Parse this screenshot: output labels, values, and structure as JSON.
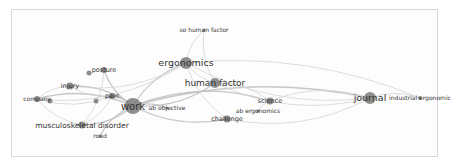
{
  "diagram": {
    "type": "keyword-co-occurrence-network",
    "nodes": [
      {
        "id": "work",
        "label": "work",
        "x": 133,
        "y": 106,
        "r": 8,
        "font": 10
      },
      {
        "id": "ergonomics",
        "label": "ergonomics",
        "x": 186,
        "y": 63,
        "r": 6,
        "font": 9.5
      },
      {
        "id": "human_factor",
        "label": "human factor",
        "x": 215,
        "y": 83,
        "r": 5,
        "font": 9
      },
      {
        "id": "journal",
        "label": "journal",
        "x": 370,
        "y": 98,
        "r": 6,
        "font": 9.5
      },
      {
        "id": "industrial_ergonomic",
        "label": "industrial ergonomic",
        "x": 420,
        "y": 98,
        "r": 2,
        "font": 6
      },
      {
        "id": "so_human_factor",
        "label": "so human factor",
        "x": 204,
        "y": 30,
        "r": 1.5,
        "font": 6
      },
      {
        "id": "posture",
        "label": "posture",
        "x": 104,
        "y": 70,
        "r": 3,
        "font": 6.5
      },
      {
        "id": "posture2",
        "label": "",
        "x": 89,
        "y": 73,
        "r": 2.5,
        "font": 6
      },
      {
        "id": "injury",
        "label": "injury",
        "x": 70,
        "y": 86,
        "r": 3.5,
        "font": 6.5
      },
      {
        "id": "pain",
        "label": "pain",
        "x": 112,
        "y": 96,
        "r": 3,
        "font": 6.5
      },
      {
        "id": "pain2",
        "label": "",
        "x": 96,
        "y": 101,
        "r": 2.5,
        "font": 6
      },
      {
        "id": "company",
        "label": "company",
        "x": 37,
        "y": 99,
        "r": 3,
        "font": 6
      },
      {
        "id": "company2",
        "label": "",
        "x": 50,
        "y": 101,
        "r": 2.5,
        "font": 6
      },
      {
        "id": "musculoskeletal_disorder",
        "label": "musculoskeletal disorder",
        "x": 82,
        "y": 125,
        "r": 3.5,
        "font": 7.5
      },
      {
        "id": "road",
        "label": "road",
        "x": 100,
        "y": 136,
        "r": 1.5,
        "font": 6
      },
      {
        "id": "ab_objective",
        "label": "ab objective",
        "x": 167,
        "y": 108,
        "r": 1.5,
        "font": 6
      },
      {
        "id": "challenge",
        "label": "challenge",
        "x": 227,
        "y": 119,
        "r": 3.5,
        "font": 6.5
      },
      {
        "id": "science",
        "label": "science",
        "x": 270,
        "y": 101,
        "r": 3.5,
        "font": 6.5
      },
      {
        "id": "ab_ergonomics",
        "label": "ab ergonomics",
        "x": 258,
        "y": 111,
        "r": 1.5,
        "font": 6
      }
    ],
    "edges": [
      [
        "work",
        "ergonomics"
      ],
      [
        "work",
        "human_factor"
      ],
      [
        "work",
        "journal"
      ],
      [
        "work",
        "challenge"
      ],
      [
        "work",
        "science"
      ],
      [
        "work",
        "injury"
      ],
      [
        "work",
        "posture"
      ],
      [
        "work",
        "company"
      ],
      [
        "work",
        "musculoskeletal_disorder"
      ],
      [
        "work",
        "pain"
      ],
      [
        "work",
        "ab_objective"
      ],
      [
        "work",
        "road"
      ],
      [
        "ergonomics",
        "so_human_factor"
      ],
      [
        "ergonomics",
        "human_factor"
      ],
      [
        "ergonomics",
        "injury"
      ],
      [
        "ergonomics",
        "journal"
      ],
      [
        "ergonomics",
        "company"
      ],
      [
        "ergonomics",
        "challenge"
      ],
      [
        "human_factor",
        "science"
      ],
      [
        "human_factor",
        "journal"
      ],
      [
        "journal",
        "industrial_ergonomic"
      ],
      [
        "journal",
        "science"
      ],
      [
        "journal",
        "challenge"
      ],
      [
        "injury",
        "company"
      ],
      [
        "posture",
        "musculoskeletal_disorder"
      ],
      [
        "company",
        "musculoskeletal_disorder"
      ],
      [
        "pain",
        "musculoskeletal_disorder"
      ],
      [
        "science",
        "ab_ergonomics"
      ],
      [
        "human_factor",
        "so_human_factor"
      ],
      [
        "injury",
        "pain"
      ],
      [
        "ergonomics",
        "industrial_ergonomic"
      ],
      [
        "company",
        "pain"
      ]
    ]
  }
}
